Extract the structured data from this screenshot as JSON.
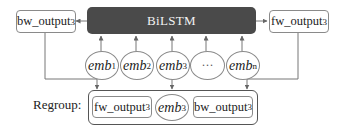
{
  "diagram": {
    "encoder": {
      "label": "BiLSTM",
      "fill": "#4a4a4a",
      "text_color": "#f2f2f2"
    },
    "outputs": {
      "backward": {
        "base": "bw_output",
        "sub": "3"
      },
      "forward": {
        "base": "fw_output",
        "sub": "3"
      }
    },
    "embeddings": [
      {
        "base": "emb",
        "sub": "1"
      },
      {
        "base": "emb",
        "sub": "2"
      },
      {
        "base": "emb",
        "sub": "3"
      },
      {
        "base": "···",
        "sub": ""
      },
      {
        "base": "emb",
        "sub": "n"
      }
    ],
    "regroup": {
      "label": "Regroup:",
      "items": [
        {
          "base": "fw_output",
          "sub": "3"
        },
        {
          "base": "emb",
          "sub": "3"
        },
        {
          "base": "bw_output",
          "sub": "3"
        }
      ]
    },
    "edges": [
      {
        "from": "emb_1",
        "to": "BiLSTM"
      },
      {
        "from": "emb_2",
        "to": "BiLSTM"
      },
      {
        "from": "emb_3",
        "to": "BiLSTM"
      },
      {
        "from": "...",
        "to": "BiLSTM"
      },
      {
        "from": "emb_n",
        "to": "BiLSTM"
      },
      {
        "from": "BiLSTM",
        "to": "bw_output_3"
      },
      {
        "from": "BiLSTM",
        "to": "fw_output_3"
      },
      {
        "from": "bw_output_3",
        "to": "Regroup"
      },
      {
        "from": "emb_3",
        "to": "Regroup"
      },
      {
        "from": "fw_output_3",
        "to": "Regroup"
      }
    ]
  }
}
